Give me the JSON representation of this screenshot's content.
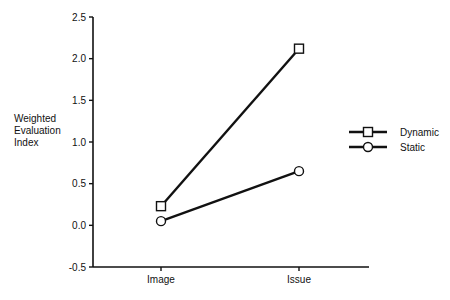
{
  "chart_data": {
    "type": "line",
    "title": "",
    "xlabel": "",
    "ylabel": "Weighted Evaluation Index",
    "ylabel_lines": [
      "Weighted",
      "Evaluation",
      "Index"
    ],
    "categories": [
      "Image",
      "Issue"
    ],
    "ylim": [
      -0.5,
      2.5
    ],
    "yticks": [
      -0.5,
      0.0,
      0.5,
      1.0,
      1.5,
      2.0,
      2.5
    ],
    "ytick_labels": [
      "-0.5",
      "0.0",
      "0.5",
      "1.0",
      "1.5",
      "2.0",
      "2.5"
    ],
    "grid": false,
    "legend_position": "right",
    "series": [
      {
        "name": "Dynamic",
        "marker": "square",
        "color": "#111111",
        "values": [
          0.23,
          2.12
        ]
      },
      {
        "name": "Static",
        "marker": "circle",
        "color": "#111111",
        "values": [
          0.05,
          0.65
        ]
      }
    ]
  }
}
